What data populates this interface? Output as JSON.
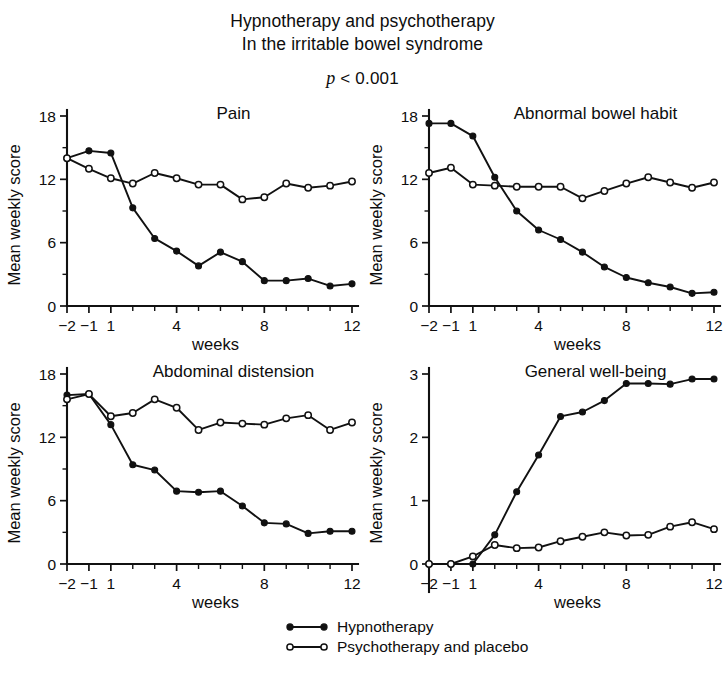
{
  "figure": {
    "title_lines": [
      "Hypnotherapy and psychotherapy",
      "In the irritable bowel syndrome"
    ],
    "p_value_italic": "p",
    "p_value_rest": "< 0.001"
  },
  "legend": {
    "position": "bottom-center",
    "entries": [
      {
        "label": "Hypnotherapy",
        "marker": "filled-circle",
        "color": "#111111"
      },
      {
        "label": "Psychotherapy and placebo",
        "marker": "open-circle",
        "color": "#111111"
      }
    ]
  },
  "axis_common": {
    "xlabel": "weeks",
    "ylabel": "Mean weekly score",
    "x_tick_labels": [
      "−2",
      "−1",
      "1",
      "4",
      "8",
      "12"
    ],
    "x_tick_values": [
      -2,
      -1,
      1,
      4,
      8,
      12
    ],
    "x_minor_values": [
      2,
      3,
      5,
      6,
      7,
      9,
      10,
      11
    ],
    "xlim": [
      -2,
      12
    ],
    "grid": false
  },
  "chart_data": [
    {
      "type": "line",
      "title": "Pain",
      "xlabel": "weeks",
      "ylabel": "Mean weekly score",
      "xlim": [
        -2,
        12
      ],
      "ylim": [
        0,
        18
      ],
      "y_ticks": [
        0,
        6,
        12,
        18
      ],
      "y_minor_ticks": [
        3,
        9,
        15
      ],
      "x": [
        -2,
        -1,
        1,
        2,
        3,
        4,
        5,
        6,
        7,
        8,
        9,
        10,
        11,
        12
      ],
      "series": [
        {
          "name": "Hypnotherapy",
          "marker": "filled-circle",
          "values": [
            14.0,
            14.7,
            14.5,
            9.3,
            6.4,
            5.2,
            3.8,
            5.1,
            4.2,
            2.4,
            2.4,
            2.6,
            1.9,
            2.1
          ]
        },
        {
          "name": "Psychotherapy and placebo",
          "marker": "open-circle",
          "values": [
            14.0,
            13.0,
            12.1,
            11.6,
            12.6,
            12.1,
            11.5,
            11.5,
            10.1,
            10.3,
            11.6,
            11.2,
            11.4,
            11.8
          ]
        }
      ]
    },
    {
      "type": "line",
      "title": "Abnormal bowel habit",
      "xlabel": "weeks",
      "ylabel": "Mean weekly score",
      "xlim": [
        -2,
        12
      ],
      "ylim": [
        0,
        18
      ],
      "y_ticks": [
        0,
        6,
        12,
        18
      ],
      "y_minor_ticks": [
        3,
        9,
        15
      ],
      "x": [
        -2,
        -1,
        1,
        2,
        3,
        4,
        5,
        6,
        7,
        8,
        9,
        10,
        11,
        12
      ],
      "series": [
        {
          "name": "Hypnotherapy",
          "marker": "filled-circle",
          "values": [
            17.3,
            17.3,
            16.1,
            12.2,
            9.0,
            7.2,
            6.3,
            5.1,
            3.7,
            2.7,
            2.2,
            1.8,
            1.2,
            1.3
          ]
        },
        {
          "name": "Psychotherapy and placebo",
          "marker": "open-circle",
          "values": [
            12.6,
            13.1,
            11.5,
            11.4,
            11.3,
            11.3,
            11.3,
            10.2,
            10.9,
            11.6,
            12.2,
            11.7,
            11.2,
            11.7
          ]
        }
      ]
    },
    {
      "type": "line",
      "title": "Abdominal distension",
      "xlabel": "weeks",
      "ylabel": "Mean weekly score",
      "xlim": [
        -2,
        12
      ],
      "ylim": [
        0,
        18
      ],
      "y_ticks": [
        0,
        6,
        12,
        18
      ],
      "y_minor_ticks": [
        3,
        9,
        15
      ],
      "x": [
        -2,
        -1,
        1,
        2,
        3,
        4,
        5,
        6,
        7,
        8,
        9,
        10,
        11,
        12
      ],
      "series": [
        {
          "name": "Hypnotherapy",
          "marker": "filled-circle",
          "values": [
            16.0,
            16.1,
            13.2,
            9.4,
            8.9,
            6.9,
            6.8,
            6.9,
            5.5,
            3.9,
            3.8,
            2.9,
            3.1,
            3.1
          ]
        },
        {
          "name": "Psychotherapy and placebo",
          "marker": "open-circle",
          "values": [
            15.6,
            16.1,
            14.0,
            14.3,
            15.6,
            14.8,
            12.7,
            13.4,
            13.3,
            13.2,
            13.8,
            14.1,
            12.7,
            13.4
          ]
        }
      ]
    },
    {
      "type": "line",
      "title": "General well-being",
      "xlabel": "weeks",
      "ylabel": "Mean weekly score",
      "xlim": [
        -2,
        12
      ],
      "ylim": [
        0,
        3
      ],
      "y_ticks": [
        0,
        1,
        2,
        3
      ],
      "y_minor_ticks": [],
      "x": [
        -2,
        -1,
        1,
        2,
        3,
        4,
        5,
        6,
        7,
        8,
        9,
        10,
        11,
        12
      ],
      "series": [
        {
          "name": "Hypnotherapy",
          "marker": "filled-circle",
          "values": [
            0.0,
            0.0,
            0.0,
            0.46,
            1.14,
            1.72,
            2.33,
            2.4,
            2.58,
            2.85,
            2.85,
            2.84,
            2.92,
            2.92
          ]
        },
        {
          "name": "Psychotherapy and placebo",
          "marker": "open-circle",
          "values": [
            0.0,
            0.0,
            0.12,
            0.3,
            0.25,
            0.26,
            0.36,
            0.43,
            0.5,
            0.45,
            0.46,
            0.59,
            0.66,
            0.55
          ]
        }
      ]
    }
  ]
}
